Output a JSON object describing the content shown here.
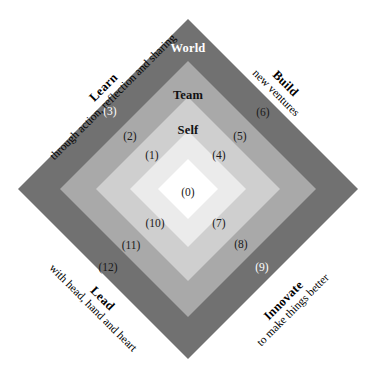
{
  "diagram": {
    "center": {
      "x": 188,
      "y": 189
    },
    "rings": [
      {
        "name": "outer",
        "color": "#717171",
        "half": 170
      },
      {
        "name": "third",
        "color": "#a9a9a9",
        "half": 128
      },
      {
        "name": "second",
        "color": "#cfcfcf",
        "half": 92
      },
      {
        "name": "inner",
        "color": "#ebebeb",
        "half": 58
      },
      {
        "name": "core",
        "color": "#ffffff",
        "half": 30
      }
    ],
    "ring_labels": [
      {
        "id": "world",
        "text": "World",
        "x": 188,
        "y": 48,
        "on_dark": true
      },
      {
        "id": "team",
        "text": "Team",
        "x": 188,
        "y": 95,
        "on_dark": false
      },
      {
        "id": "self",
        "text": "Self",
        "x": 188,
        "y": 130,
        "on_dark": false
      }
    ],
    "markers": [
      {
        "id": "m0",
        "text": "(0)",
        "x": 188,
        "y": 193,
        "on_dark": false
      },
      {
        "id": "m1",
        "text": "(1)",
        "x": 152,
        "y": 156,
        "on_dark": false
      },
      {
        "id": "m2",
        "text": "(2)",
        "x": 130,
        "y": 137,
        "on_dark": false
      },
      {
        "id": "m3",
        "text": "(3)",
        "x": 110,
        "y": 112,
        "on_dark": true
      },
      {
        "id": "m4",
        "text": "(4)",
        "x": 219,
        "y": 156,
        "on_dark": false
      },
      {
        "id": "m5",
        "text": "(5)",
        "x": 240,
        "y": 137,
        "on_dark": false
      },
      {
        "id": "m6",
        "text": "(6)",
        "x": 263,
        "y": 113,
        "on_dark": false
      },
      {
        "id": "m7",
        "text": "(7)",
        "x": 219,
        "y": 224,
        "on_dark": false
      },
      {
        "id": "m8",
        "text": "(8)",
        "x": 241,
        "y": 245,
        "on_dark": false
      },
      {
        "id": "m9",
        "text": "(9)",
        "x": 262,
        "y": 268,
        "on_dark": true
      },
      {
        "id": "m10",
        "text": "(10)",
        "x": 155,
        "y": 224,
        "on_dark": false
      },
      {
        "id": "m11",
        "text": "(11)",
        "x": 131,
        "y": 246,
        "on_dark": false
      },
      {
        "id": "m12",
        "text": "(12)",
        "x": 108,
        "y": 268,
        "on_dark": false
      }
    ],
    "quadrants": [
      {
        "id": "learn",
        "title": "Learn",
        "subtitle": "through action, reflection and sharing",
        "x": 108,
        "y": 92,
        "rotation": -45
      },
      {
        "id": "build",
        "title": "Build",
        "subtitle": "new ventures",
        "x": 281,
        "y": 88,
        "rotation": 45
      },
      {
        "id": "innovate",
        "title": "Innovate",
        "subtitle": "to make things better",
        "x": 288,
        "y": 305,
        "rotation": -45
      },
      {
        "id": "lead",
        "title": "Lead",
        "subtitle": "with head, hand and heart",
        "x": 98,
        "y": 303,
        "rotation": 45
      }
    ]
  }
}
